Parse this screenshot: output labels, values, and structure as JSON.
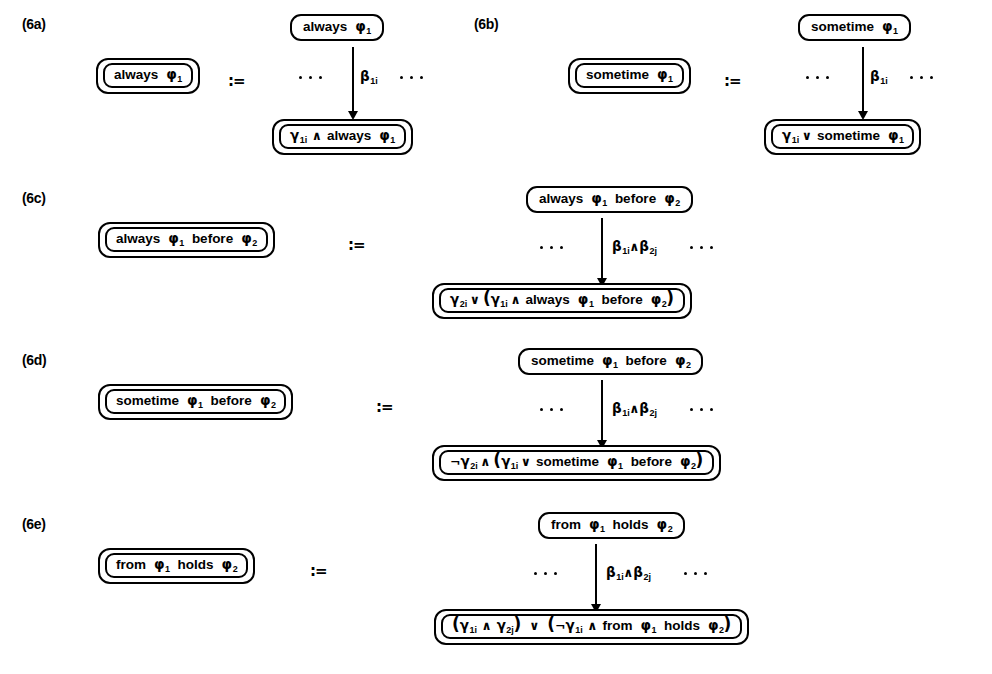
{
  "figure": {
    "caption_id": "figure-6",
    "panels": [
      {
        "id": "6a",
        "label": "(6a)",
        "lhs_box": "always φ₁",
        "define_symbol": ":=",
        "top_box": "always φ₁",
        "arrow_label": "β₁ᵢ",
        "left_ellipsis": "· · ·",
        "right_ellipsis": "· · ·",
        "bottom_box": "γ₁ᵢ ∧ always φ₁"
      },
      {
        "id": "6b",
        "label": "(6b)",
        "lhs_box": "sometime φ₁",
        "define_symbol": ":=",
        "top_box": "sometime φ₁",
        "arrow_label": "β₁ᵢ",
        "left_ellipsis": "· · ·",
        "right_ellipsis": "· · ·",
        "bottom_box": "γ₁ᵢ ∨ sometime φ₁"
      },
      {
        "id": "6c",
        "label": "(6c)",
        "lhs_box": "always φ₁ before φ₂",
        "define_symbol": ":=",
        "top_box": "always φ₁ before φ₂",
        "arrow_label": "β₁ᵢ ∧ β₂ⱼ",
        "left_ellipsis": "· · ·",
        "right_ellipsis": "· · ·",
        "bottom_box": "γ₂ᵢ ∨ (γ₁ᵢ ∧ always φ₁ before φ₂)"
      },
      {
        "id": "6d",
        "label": "(6d)",
        "lhs_box": "sometime φ₁ before φ₂",
        "define_symbol": ":=",
        "top_box": "sometime φ₁ before φ₂",
        "arrow_label": "β₁ᵢ ∧ β₂ⱼ",
        "left_ellipsis": "· · ·",
        "right_ellipsis": "· · ·",
        "bottom_box": "¬γ₂ᵢ ∧ (γ₁ᵢ ∨ sometime φ₁ before φ₂)"
      },
      {
        "id": "6e",
        "label": "(6e)",
        "lhs_box": "from φ₁ holds φ₂",
        "define_symbol": ":=",
        "top_box": "from φ₁ holds φ₂",
        "arrow_label": "β₁ᵢ ∧ β₂ⱼ",
        "left_ellipsis": "· · ·",
        "right_ellipsis": "· · ·",
        "bottom_box": "(γ₁ᵢ ∧ γ₂ⱼ) ∨ (¬γ₁ᵢ ∧ from φ₁ holds φ₂)"
      }
    ],
    "tokens": {
      "kw_always": "always",
      "kw_sometime": "sometime",
      "kw_before": "before",
      "kw_from": "from",
      "kw_holds": "holds",
      "phi": "φ",
      "gamma": "γ",
      "beta": "β",
      "and": "∧",
      "or": "∨",
      "not": "¬",
      "sub_1": "1",
      "sub_2": "2",
      "sub_1i": "1i",
      "sub_2i": "2i",
      "sub_2j": "2j",
      "paren_open": "(",
      "paren_close": ")",
      "define": ":="
    },
    "colors": {
      "ink": "#000000",
      "paper": "#ffffff"
    }
  }
}
